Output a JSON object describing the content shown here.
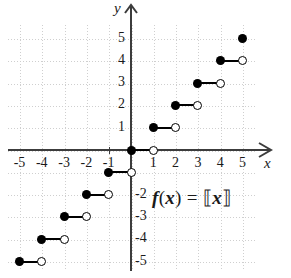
{
  "figure": {
    "equation_text": "f(x) = [[x]]",
    "equation_fx": "f",
    "equation_paren_open": "(",
    "equation_var1": "x",
    "equation_paren_close": ")",
    "equation_equals": "=",
    "equation_bracket_open": "⟦",
    "equation_var2": "x",
    "equation_bracket_close": "⟧"
  },
  "axes": {
    "x_label": "x",
    "y_label": "y",
    "x_ticks": [
      "-5",
      "-4",
      "-3",
      "-2",
      "-1",
      "1",
      "2",
      "3",
      "4",
      "5"
    ],
    "y_ticks": [
      "5",
      "4",
      "3",
      "2",
      "1",
      "-2",
      "-3",
      "-4",
      "-5"
    ],
    "axis_color": "#3c3c3c",
    "grid_color": "#cfcfcf"
  },
  "chart_data": {
    "type": "line",
    "xlabel": "x",
    "ylabel": "y",
    "xlim": [
      -5.6,
      5.8
    ],
    "ylim": [
      -5.6,
      5.8
    ],
    "grid": true,
    "legend": null,
    "function": "floor",
    "xticks": [
      -5,
      -4,
      -3,
      -2,
      -1,
      1,
      2,
      3,
      4,
      5
    ],
    "yticks": [
      5,
      4,
      3,
      2,
      1,
      -2,
      -3,
      -4,
      -5
    ],
    "steps": [
      {
        "y": -5,
        "x_start": -5,
        "x_end": -4,
        "left_point": "closed",
        "right_point": "open"
      },
      {
        "y": -4,
        "x_start": -4,
        "x_end": -3,
        "left_point": "closed",
        "right_point": "open"
      },
      {
        "y": -3,
        "x_start": -3,
        "x_end": -2,
        "left_point": "closed",
        "right_point": "open"
      },
      {
        "y": -2,
        "x_start": -2,
        "x_end": -1,
        "left_point": "closed",
        "right_point": "open"
      },
      {
        "y": -1,
        "x_start": -1,
        "x_end": 0,
        "left_point": "closed",
        "right_point": "open"
      },
      {
        "y": 0,
        "x_start": 0,
        "x_end": 1,
        "left_point": "closed",
        "right_point": "open"
      },
      {
        "y": 1,
        "x_start": 1,
        "x_end": 2,
        "left_point": "closed",
        "right_point": "open"
      },
      {
        "y": 2,
        "x_start": 2,
        "x_end": 3,
        "left_point": "closed",
        "right_point": "open"
      },
      {
        "y": 3,
        "x_start": 3,
        "x_end": 4,
        "left_point": "closed",
        "right_point": "open"
      },
      {
        "y": 4,
        "x_start": 4,
        "x_end": 5,
        "left_point": "closed",
        "right_point": "open"
      },
      {
        "y": 5,
        "x_start": 5,
        "x_end": 5,
        "left_point": "closed",
        "right_point": "none"
      }
    ]
  }
}
